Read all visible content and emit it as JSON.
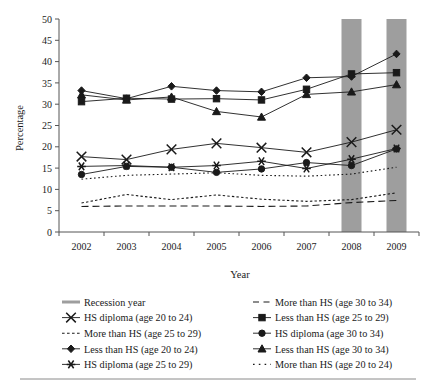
{
  "chart_data": {
    "type": "line",
    "title": "",
    "xlabel": "Year",
    "ylabel": "Percentage",
    "categories": [
      "2002",
      "2003",
      "2004",
      "2005",
      "2006",
      "2007",
      "2008",
      "2009"
    ],
    "x": [
      2002,
      2003,
      2004,
      2005,
      2006,
      2007,
      2008,
      2009
    ],
    "xlim": [
      2001.5,
      2009.5
    ],
    "ylim": [
      0,
      50
    ],
    "yticks": [
      0,
      5,
      10,
      15,
      20,
      25,
      30,
      35,
      40,
      45,
      50
    ],
    "grid": false,
    "legend_position": "below",
    "series": [
      {
        "name": "Less than HS (age 20 to 24)",
        "marker": "diamond",
        "linestyle": "solid",
        "values": [
          33.2,
          31.3,
          34.2,
          33.2,
          32.9,
          36.2,
          36.5,
          41.8
        ]
      },
      {
        "name": "Less than HS (age 25 to 29)",
        "marker": "square",
        "linestyle": "solid",
        "values": [
          30.6,
          31.4,
          31.2,
          31.3,
          31.0,
          33.5,
          37.1,
          37.4
        ]
      },
      {
        "name": "Less than HS (age 30 to 34)",
        "marker": "triangle",
        "linestyle": "solid",
        "values": [
          32.2,
          31.0,
          31.7,
          28.3,
          27.0,
          32.3,
          32.9,
          34.6
        ]
      },
      {
        "name": "HS diploma (age 20 to 24)",
        "marker": "x",
        "linestyle": "solid",
        "values": [
          17.7,
          17.0,
          19.4,
          20.8,
          19.8,
          18.7,
          21.1,
          24.0
        ]
      },
      {
        "name": "HS diploma (age 25 to 29)",
        "marker": "asterisk",
        "linestyle": "solid",
        "values": [
          15.4,
          15.6,
          15.2,
          15.6,
          16.6,
          14.9,
          17.1,
          19.6
        ]
      },
      {
        "name": "HS diploma (age 30 to 34)",
        "marker": "circle",
        "linestyle": "solid",
        "values": [
          13.5,
          15.4,
          15.2,
          14.0,
          14.8,
          16.3,
          15.6,
          19.5
        ]
      },
      {
        "name": "More than HS (age 20 to 24)",
        "marker": "none",
        "linestyle": "dotted",
        "values": [
          12.4,
          13.3,
          13.6,
          13.9,
          13.3,
          13.1,
          13.6,
          15.2
        ]
      },
      {
        "name": "More than HS (age 25 to 29)",
        "marker": "none",
        "linestyle": "dashed-fine",
        "values": [
          6.8,
          8.8,
          7.6,
          8.7,
          7.7,
          7.2,
          7.6,
          9.2
        ]
      },
      {
        "name": "More than HS (age 30 to 34)",
        "marker": "none",
        "linestyle": "dashed",
        "values": [
          6.0,
          6.1,
          6.1,
          6.1,
          6.0,
          6.1,
          6.9,
          7.4
        ]
      }
    ],
    "recession_bands": [
      {
        "label": "Recession year",
        "year": 2008
      },
      {
        "label": "Recession year",
        "year": 2009
      }
    ],
    "recession_color": "#9e9e9e"
  },
  "legend": {
    "column_left": [
      {
        "label": "Recession year",
        "style": "recession-swatch"
      },
      {
        "label": "HS diploma (age 20 to 24)",
        "style": "line-x"
      },
      {
        "label": "More than HS (age 25 to 29)",
        "style": "dashed-fine"
      },
      {
        "label": "Less than HS (age 20 to 24)",
        "style": "line-diamond"
      },
      {
        "label": "HS diploma (age 25 to 29)",
        "style": "line-asterisk"
      }
    ],
    "column_right": [
      {
        "label": "More than HS (age 30 to 34)",
        "style": "dashed"
      },
      {
        "label": "Less than HS (age 25 to 29)",
        "style": "line-square"
      },
      {
        "label": "HS diploma (age 30 to 34)",
        "style": "line-circle"
      },
      {
        "label": "Less than HS (age 30 to 34)",
        "style": "line-triangle"
      },
      {
        "label": "More than HS (age 20 to 24)",
        "style": "dotted"
      }
    ]
  },
  "colors": {
    "line": "#1a1a1a",
    "recession_band": "#9e9e9e",
    "axis": "#555555",
    "text": "#1a1a1a"
  }
}
